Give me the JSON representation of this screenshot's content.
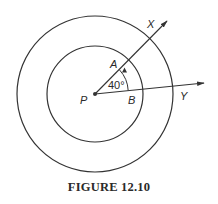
{
  "figure": {
    "caption": "FIGURE 12.10",
    "labels": {
      "center": "P",
      "point_a": "A",
      "point_b": "B",
      "ray_x": "X",
      "ray_y": "Y"
    },
    "angle_label": "40°",
    "angle_degrees": 40,
    "circles": [
      "outer",
      "inner"
    ],
    "rays": [
      "PX",
      "PY"
    ],
    "stroke_color": "#333333"
  }
}
